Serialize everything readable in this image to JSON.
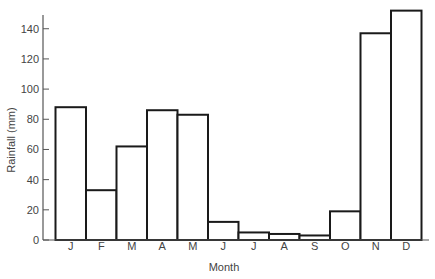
{
  "chart_data": {
    "type": "bar",
    "title": "",
    "xlabel": "Month",
    "ylabel": "Rainfall (mm)",
    "categories": [
      "J",
      "F",
      "M",
      "A",
      "M",
      "J",
      "J",
      "A",
      "S",
      "O",
      "N",
      "D"
    ],
    "values": [
      88,
      33,
      62,
      86,
      83,
      12,
      5,
      4,
      3,
      19,
      137,
      152
    ],
    "yticks": [
      0,
      20,
      40,
      60,
      80,
      100,
      120,
      140
    ],
    "ylim": [
      0,
      150
    ],
    "grid": false,
    "legend": null,
    "bar_fill": "#ffffff",
    "bar_stroke": "#1a1a1a",
    "axis_color": "#555555"
  }
}
